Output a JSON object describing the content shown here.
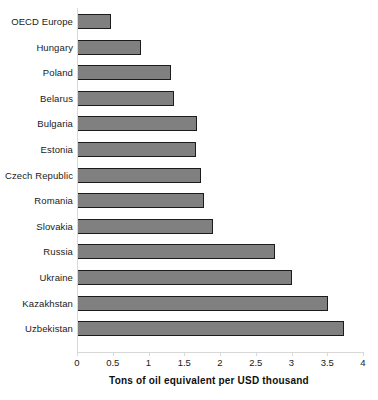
{
  "chart_data": {
    "type": "bar",
    "orientation": "horizontal",
    "title": "",
    "xlabel": "Tons of oil equivalent per USD thousand",
    "ylabel": "",
    "xlim": [
      0,
      4
    ],
    "xticks": [
      "0",
      "0.5",
      "1",
      "1.5",
      "2",
      "2.5",
      "3",
      "3.5",
      "4"
    ],
    "xtick_values": [
      0,
      0.5,
      1,
      1.5,
      2,
      2.5,
      3,
      3.5,
      4
    ],
    "grid": false,
    "legend": "none",
    "bar_color": "#808080",
    "bar_edge_color": "#1c1c1c",
    "axis_color": "#d8d8d8",
    "categories": [
      "OECD Europe",
      "Hungary",
      "Poland",
      "Belarus",
      "Bulgaria",
      "Estonia",
      "Czech Republic",
      "Romania",
      "Slovakia",
      "Russia",
      "Ukraine",
      "Kazakhstan",
      "Uzbekistan"
    ],
    "values": [
      0.48,
      0.89,
      1.31,
      1.36,
      1.68,
      1.66,
      1.73,
      1.78,
      1.9,
      2.77,
      3.01,
      3.51,
      3.73
    ],
    "bars": [
      {
        "label": "OECD Europe",
        "value": 0.48
      },
      {
        "label": "Hungary",
        "value": 0.89
      },
      {
        "label": "Poland",
        "value": 1.31
      },
      {
        "label": "Belarus",
        "value": 1.36
      },
      {
        "label": "Bulgaria",
        "value": 1.68
      },
      {
        "label": "Estonia",
        "value": 1.66
      },
      {
        "label": "Czech Republic",
        "value": 1.73
      },
      {
        "label": "Romania",
        "value": 1.78
      },
      {
        "label": "Slovakia",
        "value": 1.9
      },
      {
        "label": "Russia",
        "value": 2.77
      },
      {
        "label": "Ukraine",
        "value": 3.01
      },
      {
        "label": "Kazakhstan",
        "value": 3.51
      },
      {
        "label": "Uzbekistan",
        "value": 3.73
      }
    ]
  }
}
